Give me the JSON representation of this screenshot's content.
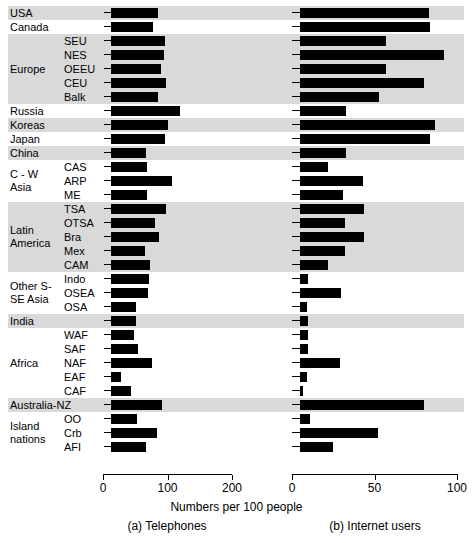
{
  "figure": {
    "x_axis_title": "Numbers per 100 people",
    "caption_a": "(a) Telephones",
    "caption_b": "(b) Internet users",
    "bar_color": "#000000",
    "band_color": "#d9d9d9",
    "background": "#ffffff"
  },
  "chart_data": {
    "type": "bar",
    "orientation": "horizontal",
    "title": "",
    "xlabel": "Numbers per 100 people",
    "ylabel": "",
    "grid": false,
    "legend": null,
    "panels": [
      {
        "key": "telephones",
        "caption": "(a) Telephones",
        "xlim": [
          0,
          230
        ],
        "xticks": [
          0,
          100,
          200
        ],
        "xticklabels": [
          "0",
          "100",
          "200"
        ]
      },
      {
        "key": "internet",
        "caption": "(b) Internet users",
        "xlim": [
          0,
          100
        ],
        "xticks": [
          0,
          50,
          100
        ],
        "xticklabels": [
          "0",
          "50",
          "100"
        ]
      }
    ],
    "groups": [
      {
        "label": "USA",
        "shaded": true,
        "rows": [
          {
            "sub": "",
            "telephones": 146,
            "internet": 78
          }
        ]
      },
      {
        "label": "Canada",
        "shaded": false,
        "rows": [
          {
            "sub": "",
            "telephones": 131,
            "internet": 79
          }
        ]
      },
      {
        "label": "Europe",
        "shaded": true,
        "rows": [
          {
            "sub": "SEU",
            "telephones": 166,
            "internet": 52
          },
          {
            "sub": "NES",
            "telephones": 164,
            "internet": 87
          },
          {
            "sub": "OEEU",
            "telephones": 154,
            "internet": 52
          },
          {
            "sub": "CEU",
            "telephones": 171,
            "internet": 75
          },
          {
            "sub": "Balk",
            "telephones": 145,
            "internet": 48
          }
        ]
      },
      {
        "label": "Russia",
        "shaded": false,
        "rows": [
          {
            "sub": "",
            "telephones": 215,
            "internet": 28
          }
        ]
      },
      {
        "label": "Koreas",
        "shaded": true,
        "rows": [
          {
            "sub": "",
            "telephones": 176,
            "internet": 82
          }
        ]
      },
      {
        "label": "Japan",
        "shaded": false,
        "rows": [
          {
            "sub": "",
            "telephones": 166,
            "internet": 79
          }
        ]
      },
      {
        "label": "China",
        "shaded": true,
        "rows": [
          {
            "sub": "",
            "telephones": 108,
            "internet": 28
          }
        ]
      },
      {
        "label": "C - W Asia",
        "shaded": false,
        "rows": [
          {
            "sub": "CAS",
            "telephones": 113,
            "internet": 17
          },
          {
            "sub": "ARP",
            "telephones": 189,
            "internet": 38
          },
          {
            "sub": "ME",
            "telephones": 111,
            "internet": 26
          }
        ]
      },
      {
        "label": "Latin America",
        "shaded": true,
        "rows": [
          {
            "sub": "TSA",
            "telephones": 171,
            "internet": 39
          },
          {
            "sub": "OTSA",
            "telephones": 135,
            "internet": 27
          },
          {
            "sub": "Bra",
            "telephones": 148,
            "internet": 39
          },
          {
            "sub": "Mex",
            "telephones": 104,
            "internet": 27
          },
          {
            "sub": "CAM",
            "telephones": 121,
            "internet": 17
          }
        ]
      },
      {
        "label": "Other S- SE Asia",
        "shaded": false,
        "rows": [
          {
            "sub": "Indo",
            "telephones": 117,
            "internet": 5
          },
          {
            "sub": "OSEA",
            "telephones": 114,
            "internet": 25
          },
          {
            "sub": "OSA",
            "telephones": 78,
            "internet": 4
          }
        ]
      },
      {
        "label": "India",
        "shaded": true,
        "rows": [
          {
            "sub": "",
            "telephones": 79,
            "internet": 5
          }
        ]
      },
      {
        "label": "Africa",
        "shaded": false,
        "rows": [
          {
            "sub": "WAF",
            "telephones": 70,
            "internet": 5
          },
          {
            "sub": "SAF",
            "telephones": 83,
            "internet": 5
          },
          {
            "sub": "NAF",
            "telephones": 128,
            "internet": 24
          },
          {
            "sub": "EAF",
            "telephones": 30,
            "internet": 4
          },
          {
            "sub": "CAF",
            "telephones": 63,
            "internet": 2
          }
        ]
      },
      {
        "label": "Australia-NZ",
        "shaded": true,
        "rows": [
          {
            "sub": "",
            "telephones": 158,
            "internet": 75
          }
        ]
      },
      {
        "label": "Island nations",
        "shaded": false,
        "rows": [
          {
            "sub": "OO",
            "telephones": 80,
            "internet": 6
          },
          {
            "sub": "Crb",
            "telephones": 142,
            "internet": 47
          },
          {
            "sub": "AFI",
            "telephones": 107,
            "internet": 20
          }
        ]
      }
    ]
  }
}
